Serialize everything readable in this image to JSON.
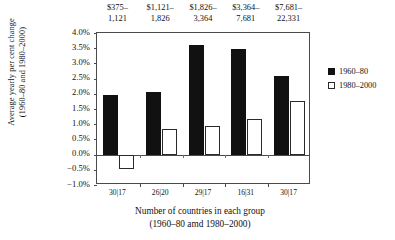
{
  "chart_data": {
    "type": "bar",
    "title": "",
    "categories": [
      "$375–1,121",
      "$1,121–1,826",
      "$1,826–3,364",
      "$3,364–7,681",
      "$7,681–22,331"
    ],
    "category_lines": [
      [
        "$375–",
        "1,121"
      ],
      [
        "$1,121–",
        "1,826"
      ],
      [
        "$1,826–",
        "3,364"
      ],
      [
        "$3,364–",
        "7,681"
      ],
      [
        "$7,681–",
        "22,331"
      ]
    ],
    "series": [
      {
        "name": "1960–80",
        "color": "#111111",
        "values": [
          1.95,
          2.05,
          3.6,
          3.48,
          2.6
        ]
      },
      {
        "name": "1980–2000",
        "color": "#ffffff",
        "values": [
          -0.47,
          0.85,
          0.95,
          1.17,
          1.75
        ]
      }
    ],
    "xtick_labels": [
      "30|17",
      "26|20",
      "29|17",
      "16|31",
      "30|17"
    ],
    "ytick_labels": [
      "4.0%",
      "3.5%",
      "3.0%",
      "2.5%",
      "2.0%",
      "1.5%",
      "1.0%",
      "0.5%",
      "0.0%",
      "−0.5%",
      "−1.0%"
    ],
    "ytick_values": [
      4.0,
      3.5,
      3.0,
      2.5,
      2.0,
      1.5,
      1.0,
      0.5,
      0.0,
      -0.5,
      -1.0
    ],
    "ylim": [
      -1.0,
      4.0
    ],
    "ylabel_lines": [
      "Average yearly per cent change",
      "(1960–80 and 1980–2000)"
    ],
    "xlabel_lines": [
      "Number of countries in each group",
      "(1960–80 amd 1980–2000)"
    ],
    "grid": false,
    "legend_position": "right"
  },
  "legend": {
    "items": [
      {
        "label": "1960–80",
        "style": "dark"
      },
      {
        "label": "1980–2000",
        "style": "light"
      }
    ]
  }
}
